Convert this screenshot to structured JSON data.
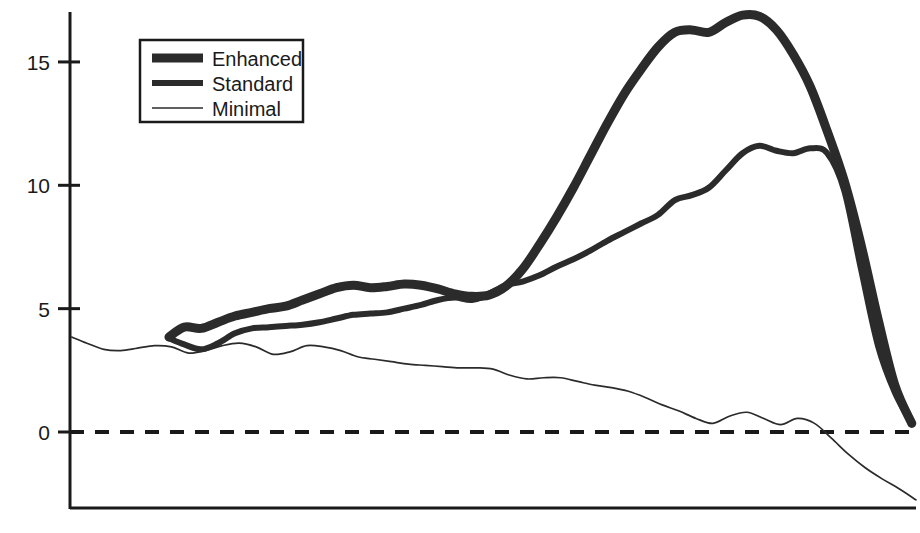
{
  "chart_data": {
    "type": "line",
    "title": "",
    "subtitle": "",
    "xlabel": "",
    "ylabel": "",
    "ylim": [
      -4,
      18
    ],
    "xlim": [
      0,
      100
    ],
    "grid": false,
    "legend_position": "top-left",
    "yticks": [
      0,
      5,
      10,
      15
    ],
    "ytick_labels": [
      "0",
      "5",
      "10",
      "15"
    ],
    "xticks": [],
    "xtick_labels": [],
    "annotations": [
      {
        "name": "zero-reference-line",
        "type": "dashed-horizontal",
        "value": 0
      }
    ],
    "series": [
      {
        "name": "Enhanced",
        "style": "thick",
        "linewidth": 9,
        "color": "#2b2b2b",
        "x": [
          11.7,
          13.5,
          15.5,
          17.5,
          19.5,
          21.5,
          23.5,
          25.5,
          27.5,
          29.5,
          31.5,
          33.5,
          35.5,
          37.5,
          39.5,
          41.5,
          43.5,
          45.5,
          47.5,
          49.5,
          51.5,
          53.5,
          55.5,
          57.5,
          59.5,
          61.5,
          63.5,
          65.5,
          67.5,
          69.5,
          71.5,
          73.5,
          75.5,
          77.5,
          79.5,
          81.5,
          83.5,
          85.5,
          87.5,
          89.5,
          91.5,
          93.5,
          95.5,
          97.5,
          99.5
        ],
        "y": [
          3.85,
          4.25,
          4.2,
          4.45,
          4.7,
          4.85,
          5.0,
          5.1,
          5.35,
          5.6,
          5.85,
          5.95,
          5.85,
          5.9,
          6.0,
          5.95,
          5.8,
          5.6,
          5.5,
          5.55,
          5.9,
          6.6,
          7.6,
          8.7,
          9.9,
          11.2,
          12.5,
          13.7,
          14.7,
          15.6,
          16.2,
          16.3,
          16.2,
          16.6,
          16.9,
          16.85,
          16.3,
          15.3,
          14.0,
          12.2,
          10.2,
          7.6,
          4.6,
          1.9,
          0.35
        ]
      },
      {
        "name": "Standard",
        "style": "medium",
        "linewidth": 6,
        "color": "#2b2b2b",
        "x": [
          11.7,
          13.5,
          15.5,
          17.5,
          19.5,
          21.5,
          23.5,
          25.5,
          27.5,
          29.5,
          31.5,
          33.5,
          35.5,
          37.5,
          39.5,
          41.5,
          43.5,
          45.5,
          47.5,
          49.5,
          51.5,
          53.5,
          55.5,
          57.5,
          59.5,
          61.5,
          63.5,
          65.5,
          67.5,
          69.5,
          71.5,
          73.5,
          75.5,
          77.5,
          79.5,
          81.5,
          83.5,
          85.5,
          87.5,
          89.5,
          91.5,
          93.5,
          95.5,
          97.5,
          99.5
        ],
        "y": [
          3.8,
          3.55,
          3.35,
          3.6,
          4.0,
          4.2,
          4.25,
          4.3,
          4.35,
          4.45,
          4.6,
          4.75,
          4.8,
          4.85,
          5.0,
          5.15,
          5.35,
          5.45,
          5.35,
          5.6,
          5.95,
          6.1,
          6.35,
          6.7,
          7.0,
          7.35,
          7.75,
          8.1,
          8.45,
          8.8,
          9.4,
          9.6,
          9.9,
          10.6,
          11.3,
          11.6,
          11.4,
          11.3,
          11.5,
          11.3,
          9.8,
          6.6,
          3.5,
          1.6,
          0.35
        ]
      },
      {
        "name": "Minimal",
        "style": "thin",
        "linewidth": 1.7,
        "color": "#2b2b2b",
        "x": [
          0.2,
          2.0,
          4.0,
          6.0,
          8.0,
          10.0,
          12.0,
          14.0,
          16.0,
          18.0,
          20.0,
          22.0,
          24.0,
          26.0,
          28.0,
          30.0,
          32.0,
          34.0,
          36.0,
          38.0,
          40.0,
          42.0,
          44.0,
          46.0,
          48.0,
          50.0,
          52.0,
          54.0,
          56.0,
          58.0,
          60.0,
          62.0,
          64.0,
          66.0,
          68.0,
          70.0,
          72.0,
          74.0,
          76.0,
          78.0,
          80.0,
          82.0,
          84.0,
          86.0,
          88.0,
          90.0,
          92.0,
          94.0,
          96.0,
          98.0,
          100.0
        ],
        "y": [
          3.85,
          3.6,
          3.35,
          3.3,
          3.4,
          3.5,
          3.45,
          3.2,
          3.3,
          3.5,
          3.6,
          3.45,
          3.15,
          3.25,
          3.5,
          3.45,
          3.3,
          3.05,
          2.95,
          2.85,
          2.75,
          2.7,
          2.65,
          2.6,
          2.6,
          2.55,
          2.3,
          2.15,
          2.2,
          2.2,
          2.05,
          1.9,
          1.8,
          1.65,
          1.4,
          1.1,
          0.85,
          0.55,
          0.35,
          0.65,
          0.8,
          0.55,
          0.3,
          0.55,
          0.35,
          -0.25,
          -0.9,
          -1.45,
          -1.9,
          -2.3,
          -2.75
        ]
      }
    ]
  },
  "legend": {
    "items": [
      {
        "label": "Enhanced",
        "swatch": "thick"
      },
      {
        "label": "Standard",
        "swatch": "medium"
      },
      {
        "label": "Minimal",
        "swatch": "thin"
      }
    ]
  },
  "colors": {
    "ink": "#1a1a1a",
    "line": "#2b2b2b",
    "background": "#ffffff"
  }
}
